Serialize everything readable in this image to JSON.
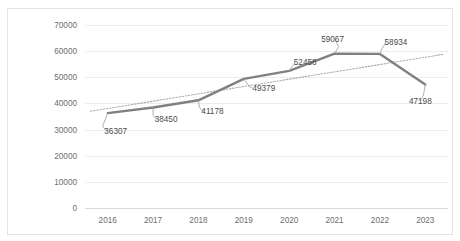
{
  "chart_data": {
    "type": "line",
    "title": "",
    "xlabel": "",
    "ylabel": "",
    "categories": [
      "2016",
      "2017",
      "2018",
      "2019",
      "2020",
      "2021",
      "2022",
      "2023"
    ],
    "values": [
      36307,
      38450,
      41178,
      49379,
      52458,
      59067,
      58934,
      47198
    ],
    "data_labels": [
      "36307",
      "38450",
      "41178",
      "49379",
      "52458",
      "59067",
      "58934",
      "47198"
    ],
    "series": [
      {
        "name": "series-1",
        "style": "solid",
        "color": "#808080",
        "values": [
          36307,
          38450,
          41178,
          49379,
          52458,
          59067,
          58934,
          47198
        ]
      },
      {
        "name": "linear-trendline",
        "style": "dotted",
        "color": "#adadad",
        "values": [
          38000,
          41000,
          44000,
          47000,
          50000,
          53000,
          56000,
          58300
        ]
      }
    ],
    "ylim": [
      0,
      70000
    ],
    "ytick_labels": [
      "0",
      "10000",
      "20000",
      "30000",
      "40000",
      "50000",
      "60000",
      "70000"
    ],
    "ytick_values": [
      0,
      10000,
      20000,
      30000,
      40000,
      50000,
      60000,
      70000
    ],
    "xtick_labels": [
      "2016",
      "2017",
      "2018",
      "2019",
      "2020",
      "2021",
      "2022",
      "2023"
    ],
    "grid": "horizontal",
    "legend": "none",
    "border": true,
    "colors": {
      "series": "#808080",
      "trendline": "#adadad",
      "gridline": "#ededed",
      "axis": "#d9d9d9",
      "tick_text": "#6d6d6d",
      "label_text": "#4a4a4a",
      "frame_border": "#e2e2e2",
      "background": "#ffffff"
    }
  }
}
